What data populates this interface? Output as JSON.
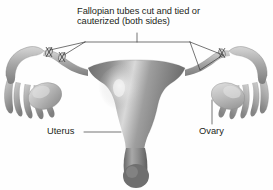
{
  "figure": {
    "background_color": "#fefefe",
    "text_color": "#231f20",
    "leader_line_color": "#3a3a3a",
    "width": 273,
    "height": 190
  },
  "labels": {
    "tubes_line1": "Fallopian tubes cut and tied or",
    "tubes_line2": "cauterized (both sides)",
    "uterus": "Uterus",
    "ovary": "Ovary"
  },
  "anatomy": {
    "uterus": {
      "name": "uterus-body",
      "fill_dark": "#6e6e6e",
      "fill_mid": "#8a8a8a",
      "fill_light": "#b9b9b9",
      "highlight": "#e6e6e6"
    },
    "fallopian_tube": {
      "name": "fallopian-tube",
      "fill_dark": "#8d8d8d",
      "fill_light": "#cfcfcf"
    },
    "ovary": {
      "name": "ovary",
      "fill_dark": "#9b9b9b",
      "fill_light": "#d8d8d8"
    },
    "fimbriae": {
      "name": "fimbriae",
      "fill_dark": "#8f8f8f",
      "fill_light": "#cccccc"
    },
    "ligation_marks": {
      "name": "ligation-clip",
      "count": 2,
      "sides": [
        "left",
        "right"
      ],
      "color": "#3a3a3a"
    },
    "cervix": {
      "name": "cervix",
      "fill_dark": "#6a6a6a",
      "fill_light": "#a6a6a6"
    }
  },
  "leaders": {
    "tubes_bracket": "bracket from caption down to both cut tube sites",
    "uterus_leader": "horizontal line from Uterus text to uterus body",
    "ovary_leader": "vertical line from Ovary text up to right ovary"
  }
}
